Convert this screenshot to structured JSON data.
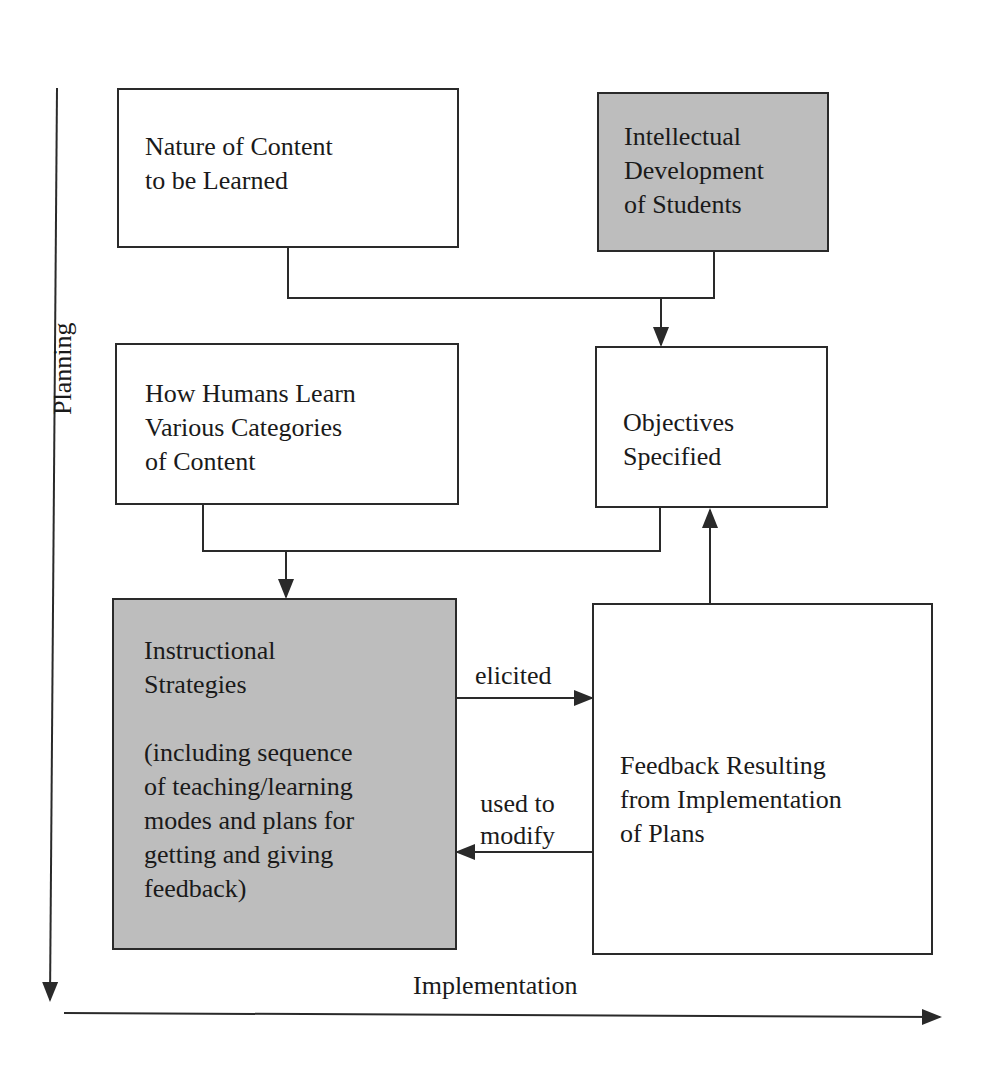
{
  "diagram": {
    "boxes": {
      "nature_content": {
        "text": "Nature of Content\nto be Learned",
        "shaded": false
      },
      "intellectual_dev": {
        "text": "Intellectual\nDevelopment\nof Students",
        "shaded": true
      },
      "how_humans_learn": {
        "text": "How Humans Learn\nVarious Categories\nof Content",
        "shaded": false
      },
      "objectives": {
        "text": "Objectives\nSpecified",
        "shaded": false
      },
      "instructional": {
        "text": "Instructional\nStrategies\n\n(including sequence\nof teaching/learning\nmodes and plans for\ngetting and giving\nfeedback)",
        "shaded": true
      },
      "feedback": {
        "text": "Feedback Resulting\nfrom Implementation\nof Plans",
        "shaded": false
      }
    },
    "edge_labels": {
      "elicited": "elicited",
      "used_to_modify": "used to\nmodify"
    },
    "axes": {
      "vertical": "Planning",
      "horizontal": "Implementation"
    },
    "colors": {
      "shaded_fill": "#bdbdbd",
      "line": "#2a2a2a"
    }
  }
}
